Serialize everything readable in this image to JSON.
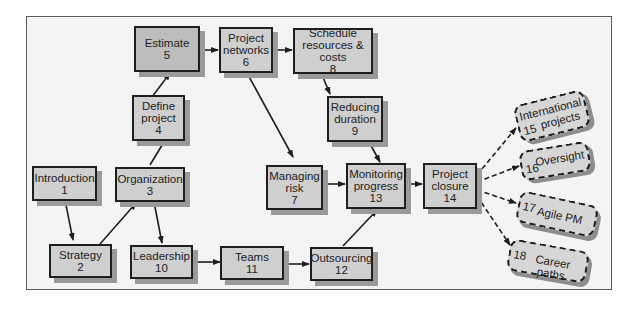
{
  "diagram": {
    "nodes": [
      {
        "id": "1",
        "label": "Introduction",
        "number": "1"
      },
      {
        "id": "2",
        "label": "Strategy",
        "number": "2"
      },
      {
        "id": "3",
        "label": "Organization",
        "number": "3"
      },
      {
        "id": "4",
        "label_lines": [
          "Define",
          "project"
        ],
        "number": "4"
      },
      {
        "id": "5",
        "label": "Estimate",
        "number": "5"
      },
      {
        "id": "6",
        "label_lines": [
          "Project",
          "networks"
        ],
        "number": "6"
      },
      {
        "id": "7",
        "label_lines": [
          "Managing",
          "risk"
        ],
        "number": "7"
      },
      {
        "id": "8",
        "label_lines": [
          "Schedule",
          "resources & costs"
        ],
        "number": "8"
      },
      {
        "id": "9",
        "label_lines": [
          "Reducing",
          "duration"
        ],
        "number": "9"
      },
      {
        "id": "10",
        "label": "Leadership",
        "number": "10"
      },
      {
        "id": "11",
        "label": "Teams",
        "number": "11"
      },
      {
        "id": "12",
        "label": "Outsourcing",
        "number": "12"
      },
      {
        "id": "13",
        "label_lines": [
          "Monitoring",
          "progress"
        ],
        "number": "13"
      },
      {
        "id": "14",
        "label_lines": [
          "Project",
          "closure"
        ],
        "number": "14"
      },
      {
        "id": "15",
        "label_lines": [
          "International",
          "projects"
        ],
        "number": "15",
        "style": "dashed"
      },
      {
        "id": "16",
        "label": "Oversight",
        "number": "16",
        "style": "dashed"
      },
      {
        "id": "17",
        "label": "Agile PM",
        "number": "17",
        "style": "dashed"
      },
      {
        "id": "18",
        "label": "Career paths",
        "number": "18",
        "style": "dashed"
      }
    ],
    "edges": [
      {
        "from": "1",
        "to": "2"
      },
      {
        "from": "2",
        "to": "3"
      },
      {
        "from": "3",
        "to": "4"
      },
      {
        "from": "3",
        "to": "10"
      },
      {
        "from": "4",
        "to": "5"
      },
      {
        "from": "5",
        "to": "6"
      },
      {
        "from": "6",
        "to": "8"
      },
      {
        "from": "6",
        "to": "7"
      },
      {
        "from": "8",
        "to": "9"
      },
      {
        "from": "9",
        "to": "13"
      },
      {
        "from": "7",
        "to": "13"
      },
      {
        "from": "10",
        "to": "11"
      },
      {
        "from": "11",
        "to": "12"
      },
      {
        "from": "12",
        "to": "13"
      },
      {
        "from": "13",
        "to": "14"
      },
      {
        "from": "14",
        "to": "15",
        "style": "dashed"
      },
      {
        "from": "14",
        "to": "16",
        "style": "dashed"
      },
      {
        "from": "14",
        "to": "17",
        "style": "dashed"
      },
      {
        "from": "14",
        "to": "18",
        "style": "dashed"
      }
    ],
    "colors": {
      "box_fill": "#cfcfcf",
      "box_border": "#1e1e1e",
      "shadow": "#9a9a9a",
      "background": "#f4f4f4"
    }
  }
}
